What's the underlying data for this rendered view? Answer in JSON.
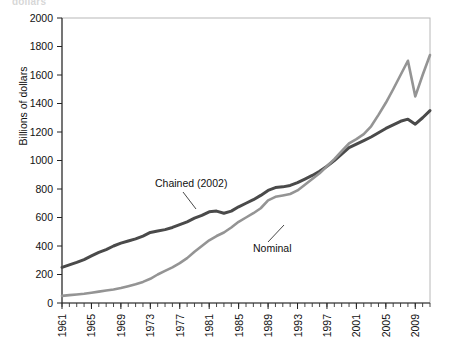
{
  "figure": {
    "cut_off_header": "dollars",
    "ylabel": "Billions of dollars"
  },
  "annotations": {
    "chained_label": "Chained (2002)",
    "nominal_label": "Nominal"
  },
  "colors": {
    "chained": "#4a4a4a",
    "nominal": "#949494",
    "frame": "#b8b8b8",
    "axis": "#222222",
    "text": "#111111"
  },
  "chart_data": {
    "type": "line",
    "title": "",
    "xlabel": "",
    "ylabel": "Billions of dollars",
    "xlim": [
      1961,
      2011
    ],
    "ylim": [
      0,
      2000
    ],
    "grid": false,
    "legend": "inline-annotations",
    "ytick_labels": [
      "0",
      "200",
      "400",
      "600",
      "800",
      "1000",
      "1200",
      "1400",
      "1600",
      "1800",
      "2000"
    ],
    "ytick_values": [
      0,
      200,
      400,
      600,
      800,
      1000,
      1200,
      1400,
      1600,
      1800,
      2000
    ],
    "xtick_labels": [
      "1961",
      "1965",
      "1969",
      "1973",
      "1977",
      "1981",
      "1985",
      "1989",
      "1993",
      "1997",
      "2001",
      "2005",
      "2009"
    ],
    "xtick_values": [
      1961,
      1965,
      1969,
      1973,
      1977,
      1981,
      1985,
      1989,
      1993,
      1997,
      2001,
      2005,
      2009
    ],
    "x": [
      1961,
      1962,
      1963,
      1964,
      1965,
      1966,
      1967,
      1968,
      1969,
      1970,
      1971,
      1972,
      1973,
      1974,
      1975,
      1976,
      1977,
      1978,
      1979,
      1980,
      1981,
      1982,
      1983,
      1984,
      1985,
      1986,
      1987,
      1988,
      1989,
      1990,
      1991,
      1992,
      1993,
      1994,
      1995,
      1996,
      1997,
      1998,
      1999,
      2000,
      2001,
      2002,
      2003,
      2004,
      2005,
      2006,
      2007,
      2008,
      2009,
      2010,
      2011
    ],
    "series": [
      {
        "name": "Chained (2002)",
        "color": "#4a4a4a",
        "values": [
          250,
          268,
          285,
          305,
          330,
          355,
          375,
          400,
          420,
          435,
          450,
          470,
          495,
          505,
          515,
          530,
          550,
          570,
          595,
          615,
          640,
          645,
          630,
          645,
          675,
          700,
          725,
          755,
          790,
          810,
          815,
          825,
          845,
          870,
          895,
          925,
          960,
          1000,
          1045,
          1090,
          1115,
          1140,
          1165,
          1195,
          1225,
          1250,
          1275,
          1290,
          1255,
          1300,
          1350
        ]
      },
      {
        "name": "Nominal",
        "color": "#949494",
        "values": [
          50,
          55,
          60,
          65,
          72,
          80,
          88,
          95,
          105,
          118,
          132,
          148,
          170,
          200,
          225,
          250,
          280,
          315,
          360,
          400,
          440,
          470,
          495,
          530,
          570,
          600,
          630,
          665,
          720,
          745,
          755,
          765,
          790,
          830,
          870,
          910,
          960,
          1010,
          1065,
          1120,
          1150,
          1185,
          1240,
          1320,
          1405,
          1500,
          1600,
          1700,
          1450,
          1600,
          1740
        ]
      }
    ],
    "notes": [
      "Chained series shows a dip/plateau around 1981-1983",
      "Nominal series flattens around 1990-1992",
      "Series cross near 2001-2002 (chained base year)",
      "Nominal peaks near 1700 in 2008, drops to ~1450 in 2009, then rises to ~1740"
    ]
  }
}
